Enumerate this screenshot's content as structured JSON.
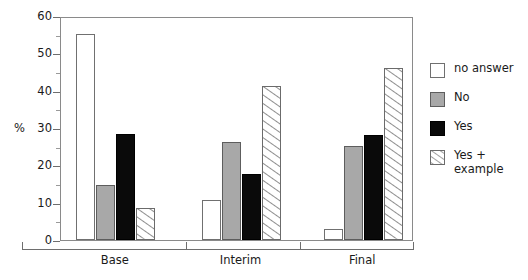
{
  "chart_data": {
    "type": "bar",
    "title": "",
    "subtitle": "",
    "xlabel": "",
    "ylabel": "%",
    "ylim": [
      0,
      60
    ],
    "ytick_labels": [
      "0",
      "10",
      "20",
      "30",
      "40",
      "50",
      "60"
    ],
    "ytick_values": [
      0,
      10,
      20,
      30,
      40,
      50,
      60
    ],
    "yminor_values": [
      5,
      15,
      25,
      35,
      45,
      55
    ],
    "grid": false,
    "legend_position": "right",
    "categories": [
      "Base",
      "Interim",
      "Final"
    ],
    "series": [
      {
        "name": "no answer",
        "style": "white",
        "values": [
          55.3,
          10.7,
          3.0
        ]
      },
      {
        "name": "No",
        "style": "gray",
        "values": [
          14.8,
          26.3,
          25.2
        ]
      },
      {
        "name": "Yes",
        "style": "black",
        "values": [
          28.5,
          17.7,
          28.2
        ]
      },
      {
        "name": "Yes + example",
        "style": "hatched",
        "values": [
          8.5,
          41.3,
          46.0
        ]
      }
    ]
  },
  "legend": {
    "items": [
      {
        "label": "no answer",
        "swatch": "white-swatch"
      },
      {
        "label": "No",
        "swatch": "gray-swatch"
      },
      {
        "label": "Yes",
        "swatch": "black-swatch"
      },
      {
        "label": "Yes +\nexample",
        "swatch": "hatched-swatch"
      }
    ]
  },
  "colors": {
    "gray_fill": "#a8a8a8",
    "black_fill": "#0a0a0a",
    "white_fill": "#ffffff",
    "axis": "#6e6e6e",
    "frame": "#8a8a8a"
  }
}
